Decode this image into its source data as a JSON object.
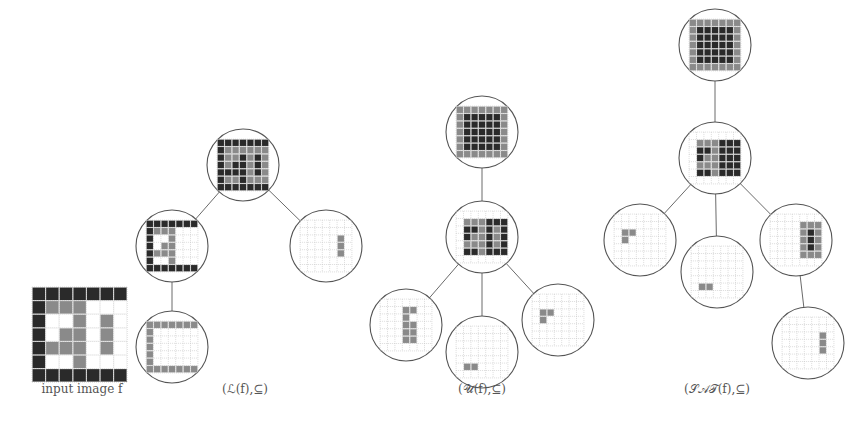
{
  "colors": {
    "black": "#2a2a2a",
    "gray": "#8a8a8a",
    "white": "#ffffff",
    "grid": "#c4c4c4",
    "line": "#6a6a6a"
  },
  "input_image": {
    "label": "input image f",
    "grid": [
      "BBBBBBB",
      "BGGGWWW",
      "BWWGWGW",
      "BWGGWGW",
      "BGGGWGW",
      "BWWGWWW",
      "BBBBBBB"
    ]
  },
  "trees": [
    {
      "id": "lower",
      "caption": "(ℒ(f),⊆)",
      "caption_pos": [
        245,
        392
      ],
      "nodes": [
        {
          "id": "l0",
          "cx": 243,
          "cy": 165,
          "grid": [
            "BBBBBBB",
            "BGGGGGG",
            "BGGBGBG",
            "BGBBGBG",
            "BBBBGBG",
            "BGGBGGG",
            "BBBBBBB"
          ]
        },
        {
          "id": "l1",
          "cx": 172,
          "cy": 246,
          "grid": [
            "BBBBBBB",
            "BGGG...",
            "B..G...",
            "B.GG...",
            "BGGG...",
            "B..G...",
            "BBBBBBB"
          ]
        },
        {
          "id": "l2",
          "cx": 326,
          "cy": 246,
          "grid": [
            ".......",
            ".......",
            ".....G.",
            ".....G.",
            ".....G.",
            ".......",
            "......."
          ]
        },
        {
          "id": "l3",
          "cx": 172,
          "cy": 347,
          "grid": [
            "GGGGGGG",
            "G......",
            "G......",
            "G......",
            "G......",
            "G......",
            "GGGGGGG"
          ]
        }
      ],
      "edges": [
        [
          "l0",
          "l1"
        ],
        [
          "l0",
          "l2"
        ],
        [
          "l1",
          "l3"
        ]
      ]
    },
    {
      "id": "upper",
      "caption": "(𝒰(f),⊆)",
      "caption_pos": [
        482,
        392
      ],
      "nodes": [
        {
          "id": "u0",
          "cx": 482,
          "cy": 132,
          "grid": [
            "GGGGGGG",
            "GBBBBBG",
            "GBBBBBG",
            "GBBBBBG",
            "GBBBBBG",
            "GBBBBBG",
            "GGGGGGG"
          ]
        },
        {
          "id": "u1",
          "cx": 482,
          "cy": 237,
          "grid": [
            ".......",
            ".GGGBBB",
            ".BBGBGB",
            ".BGGBGB",
            ".GGGBGB",
            ".BBGBBB",
            "......."
          ]
        },
        {
          "id": "u2",
          "cx": 406,
          "cy": 325,
          "grid": [
            ".......",
            "...GG..",
            "...G...",
            "...GG..",
            "...GG..",
            "...GG..",
            "......."
          ]
        },
        {
          "id": "u3",
          "cx": 482,
          "cy": 352,
          "grid": [
            ".......",
            ".......",
            ".......",
            ".......",
            ".......",
            ".GG....",
            "......."
          ]
        },
        {
          "id": "u4",
          "cx": 558,
          "cy": 320,
          "grid": [
            ".......",
            ".......",
            ".GG....",
            ".G.....",
            ".......",
            ".......",
            "......."
          ]
        }
      ],
      "edges": [
        [
          "u0",
          "u1"
        ],
        [
          "u1",
          "u2"
        ],
        [
          "u1",
          "u3"
        ],
        [
          "u1",
          "u4"
        ]
      ]
    },
    {
      "id": "sat",
      "caption": "(𝒮𝒜𝒯(f),⊆)",
      "caption_pos": [
        717,
        392
      ],
      "nodes": [
        {
          "id": "s0",
          "cx": 715,
          "cy": 45,
          "grid": [
            "GGGGGGG",
            "GBBBBBG",
            "GBBBBBG",
            "GBBBBBG",
            "GBBBBBG",
            "GBBBBBG",
            "GGGGGGG"
          ]
        },
        {
          "id": "s1",
          "cx": 715,
          "cy": 158,
          "grid": [
            ".......",
            ".GGGBBB",
            ".BBGBBB",
            ".BGGBBB",
            ".GGGBBB",
            ".BBGBBB",
            "......."
          ]
        },
        {
          "id": "s2",
          "cx": 640,
          "cy": 240,
          "grid": [
            ".......",
            ".......",
            ".GG....",
            ".G.....",
            ".......",
            ".......",
            "......."
          ]
        },
        {
          "id": "s3",
          "cx": 717,
          "cy": 272,
          "grid": [
            ".......",
            ".......",
            ".......",
            ".......",
            ".......",
            ".GG....",
            "......."
          ]
        },
        {
          "id": "s4",
          "cx": 796,
          "cy": 240,
          "grid": [
            ".......",
            "....GGG",
            "....GBG",
            "....GBG",
            "....GBG",
            "....GGG",
            "......."
          ]
        },
        {
          "id": "s5",
          "cx": 808,
          "cy": 343,
          "grid": [
            ".......",
            ".......",
            ".....G.",
            ".....G.",
            ".....G.",
            ".......",
            "......."
          ]
        }
      ],
      "edges": [
        [
          "s0",
          "s1"
        ],
        [
          "s1",
          "s2"
        ],
        [
          "s1",
          "s3"
        ],
        [
          "s1",
          "s4"
        ],
        [
          "s4",
          "s5"
        ]
      ]
    }
  ],
  "node_radius": 36
}
